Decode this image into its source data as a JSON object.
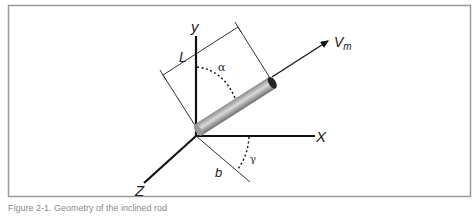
{
  "figure": {
    "labels": {
      "y_axis": "y",
      "x_axis": "X",
      "z_axis": "Z",
      "length": "L",
      "velocity": "V",
      "velocity_sub": "m",
      "alpha": "α",
      "gamma": "γ",
      "offset": "b"
    },
    "colors": {
      "frame": "#9a9a9a",
      "axes": "#111111",
      "thin_lines": "#333333",
      "cylinder_light": "#d8d8d8",
      "cylinder_dark": "#7a7a7a"
    }
  },
  "caption": {
    "text": "Figure 2-1. Geometry of the inclined rod"
  }
}
